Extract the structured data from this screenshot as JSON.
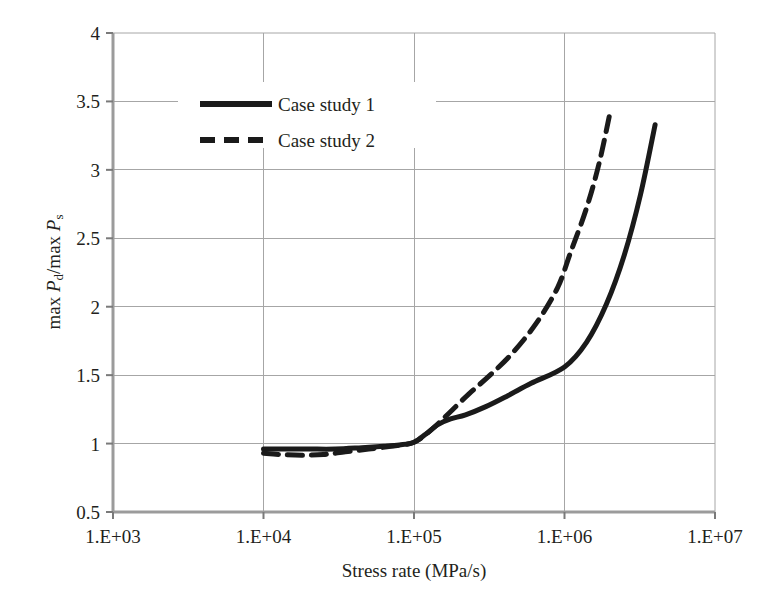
{
  "figure": {
    "background_color": "#ffffff",
    "plot_border_color": "#9b9b9b",
    "grid_color": "#a6a6a6",
    "series_color": "#1a1a1a"
  },
  "axis": {
    "x": {
      "title": "Stress rate (MPa/s)",
      "tick_labels": [
        "1.E+03",
        "1.E+04",
        "1.E+05",
        "1.E+06",
        "1.E+07"
      ],
      "tick_values": [
        1000,
        10000,
        100000,
        1000000,
        10000000
      ],
      "scale": "log",
      "range": [
        1000,
        10000000
      ]
    },
    "y": {
      "title_parts": {
        "p1": "max ",
        "p2": "P",
        "p2sub": "d",
        "p3": "/max ",
        "p4": "P",
        "p4sub": "s"
      },
      "title_plain": "max Pd/max Ps",
      "tick_labels": [
        "0.5",
        "1",
        "1.5",
        "2",
        "2.5",
        "3",
        "3.5",
        "4"
      ],
      "tick_values": [
        0.5,
        1,
        1.5,
        2,
        2.5,
        3,
        3.5,
        4
      ],
      "scale": "linear",
      "range": [
        0.5,
        4
      ]
    }
  },
  "legend": {
    "position": "top-left-inside",
    "entries": [
      {
        "label": "Case study 1",
        "style": "solid",
        "color": "#1a1a1a"
      },
      {
        "label": "Case study 2",
        "style": "dashed",
        "color": "#1a1a1a"
      }
    ]
  },
  "chart_data": {
    "type": "line",
    "title": "",
    "xlabel": "Stress rate (MPa/s)",
    "ylabel": "max Pd/max Ps",
    "xscale": "log",
    "xlim": [
      1000,
      10000000
    ],
    "ylim": [
      0.5,
      4
    ],
    "grid": true,
    "legend_position": "top-left-inside",
    "series": [
      {
        "name": "Case study 1",
        "style": "solid",
        "color": "#1a1a1a",
        "points": [
          {
            "x": 10000,
            "y": 0.96
          },
          {
            "x": 14000,
            "y": 0.96
          },
          {
            "x": 20000,
            "y": 0.96
          },
          {
            "x": 30000,
            "y": 0.96
          },
          {
            "x": 45000,
            "y": 0.97
          },
          {
            "x": 63000,
            "y": 0.98
          },
          {
            "x": 80000,
            "y": 0.99
          },
          {
            "x": 100000,
            "y": 1.01
          },
          {
            "x": 120000,
            "y": 1.07
          },
          {
            "x": 145000,
            "y": 1.14
          },
          {
            "x": 175000,
            "y": 1.18
          },
          {
            "x": 220000,
            "y": 1.21
          },
          {
            "x": 300000,
            "y": 1.27
          },
          {
            "x": 420000,
            "y": 1.35
          },
          {
            "x": 600000,
            "y": 1.44
          },
          {
            "x": 1000000,
            "y": 1.56
          },
          {
            "x": 1400000,
            "y": 1.74
          },
          {
            "x": 1900000,
            "y": 2.02
          },
          {
            "x": 2500000,
            "y": 2.38
          },
          {
            "x": 3200000,
            "y": 2.82
          },
          {
            "x": 4000000,
            "y": 3.33
          }
        ]
      },
      {
        "name": "Case study 2",
        "style": "dashed",
        "color": "#1a1a1a",
        "points": [
          {
            "x": 10000,
            "y": 0.93
          },
          {
            "x": 13000,
            "y": 0.92
          },
          {
            "x": 18000,
            "y": 0.915
          },
          {
            "x": 25000,
            "y": 0.92
          },
          {
            "x": 35000,
            "y": 0.94
          },
          {
            "x": 50000,
            "y": 0.96
          },
          {
            "x": 70000,
            "y": 0.98
          },
          {
            "x": 100000,
            "y": 1.01
          },
          {
            "x": 130000,
            "y": 1.1
          },
          {
            "x": 170000,
            "y": 1.22
          },
          {
            "x": 230000,
            "y": 1.36
          },
          {
            "x": 320000,
            "y": 1.5
          },
          {
            "x": 450000,
            "y": 1.66
          },
          {
            "x": 650000,
            "y": 1.88
          },
          {
            "x": 900000,
            "y": 2.14
          },
          {
            "x": 1100000,
            "y": 2.4
          },
          {
            "x": 1400000,
            "y": 2.72
          },
          {
            "x": 1700000,
            "y": 3.05
          },
          {
            "x": 2000000,
            "y": 3.41
          }
        ]
      }
    ]
  },
  "plot_geometry": {
    "left": 113,
    "right": 715,
    "top": 33,
    "bottom": 512
  }
}
